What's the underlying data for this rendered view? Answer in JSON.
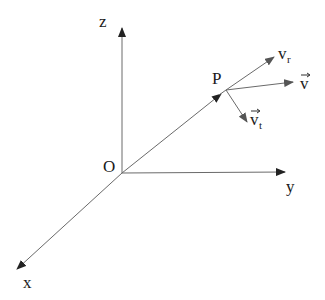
{
  "diagram": {
    "type": "3d-coordinate-velocity-decomposition",
    "colors": {
      "line": "#6a6a6a",
      "arrowhead": "#222222",
      "text": "#1a1a1a",
      "background": "#ffffff"
    },
    "origin": {
      "label": "O",
      "x": 122,
      "y": 173
    },
    "axes": [
      {
        "id": "z",
        "label": "z",
        "from": [
          122,
          173
        ],
        "to": [
          122,
          27
        ]
      },
      {
        "id": "y",
        "label": "y",
        "from": [
          122,
          173
        ],
        "to": [
          285,
          172
        ]
      },
      {
        "id": "x",
        "label": "x",
        "from": [
          122,
          173
        ],
        "to": [
          16,
          270
        ]
      }
    ],
    "point": {
      "label": "P",
      "x": 226,
      "y": 90
    },
    "vectors": [
      {
        "id": "v_r",
        "base": "v",
        "sub": "r",
        "has_arrow_over": false,
        "from": [
          226,
          90
        ],
        "to": [
          274,
          57
        ]
      },
      {
        "id": "v",
        "base": "v",
        "sub": "",
        "has_arrow_over": true,
        "from": [
          226,
          90
        ],
        "to": [
          293,
          82
        ]
      },
      {
        "id": "v_t",
        "base": "v",
        "sub": "t",
        "has_arrow_over": true,
        "from": [
          226,
          90
        ],
        "to": [
          247,
          122
        ]
      }
    ],
    "labels": {
      "z": "z",
      "y": "y",
      "x": "x",
      "O": "O",
      "P": "P",
      "v_r_base": "v",
      "v_r_sub": "r",
      "v_base": "v",
      "v_t_base": "v",
      "v_t_sub": "t"
    }
  }
}
